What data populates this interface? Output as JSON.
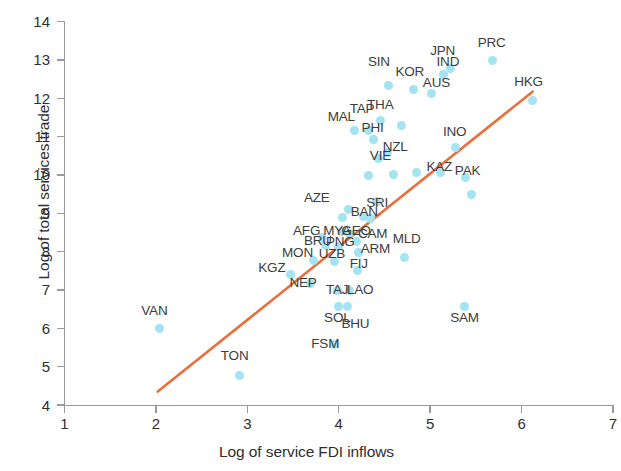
{
  "chart_data": {
    "type": "scatter",
    "title": "",
    "xlabel": "Log of service FDI inflows",
    "ylabel": "Log of total services trade",
    "xlim": [
      1,
      7
    ],
    "ylim": [
      4,
      14
    ],
    "xticks": [
      "1",
      "2",
      "3",
      "4",
      "5",
      "6",
      "7"
    ],
    "yticks": [
      "4",
      "5",
      "6",
      "7",
      "8",
      "9",
      "10",
      "11",
      "12",
      "13",
      "14"
    ],
    "grid": false,
    "legend": "none",
    "point_color": "#a4e3f2",
    "trendline_color": "#e8703c",
    "trendline": {
      "x0": 2.02,
      "y0": 4.35,
      "x1": 6.12,
      "y1": 12.17,
      "label": "fitted regression line"
    },
    "points": [
      {
        "label": "VAN",
        "x": 2.04,
        "y": 5.99,
        "lx": 1.84,
        "ly": 6.45
      },
      {
        "label": "TON",
        "x": 2.91,
        "y": 4.78,
        "lx": 2.71,
        "ly": 5.27
      },
      {
        "label": "KGZ",
        "x": 3.47,
        "y": 7.41,
        "lx": 3.12,
        "ly": 7.58
      },
      {
        "label": "NEP",
        "x": 3.69,
        "y": 7.17,
        "lx": 3.46,
        "ly": 7.17
      },
      {
        "label": "MON",
        "x": 3.72,
        "y": 7.77,
        "lx": 3.38,
        "ly": 7.97
      },
      {
        "label": "BRU",
        "x": 3.86,
        "y": 8.17,
        "lx": 3.62,
        "ly": 8.27
      },
      {
        "label": "AFG",
        "x": 3.82,
        "y": 8.36,
        "lx": 3.5,
        "ly": 8.55
      },
      {
        "label": "UZB",
        "x": 3.95,
        "y": 7.73,
        "lx": 3.78,
        "ly": 7.93
      },
      {
        "label": "PNG",
        "x": 4.0,
        "y": 8.12,
        "lx": 3.86,
        "ly": 8.26
      },
      {
        "label": "MYA",
        "x": 4.03,
        "y": 8.52,
        "lx": 3.83,
        "ly": 8.55
      },
      {
        "label": "GEO",
        "x": 4.12,
        "y": 8.46,
        "lx": 4.03,
        "ly": 8.55
      },
      {
        "label": "CAM",
        "x": 4.19,
        "y": 8.26,
        "lx": 4.21,
        "ly": 8.47
      },
      {
        "label": "ARM",
        "x": 4.22,
        "y": 7.98,
        "lx": 4.24,
        "ly": 8.08
      },
      {
        "label": "FIJ",
        "x": 4.2,
        "y": 7.52,
        "lx": 4.12,
        "ly": 7.67
      },
      {
        "label": "TAJ",
        "x": 3.99,
        "y": 6.98,
        "lx": 3.86,
        "ly": 7.0
      },
      {
        "label": "LAO",
        "x": 4.12,
        "y": 6.98,
        "lx": 4.09,
        "ly": 7.0
      },
      {
        "label": "AZE",
        "x": 4.11,
        "y": 9.1,
        "lx": 3.62,
        "ly": 9.41
      },
      {
        "label": "BAN",
        "x": 4.35,
        "y": 8.86,
        "lx": 4.13,
        "ly": 9.03
      },
      {
        "label": "SRI",
        "x": 4.41,
        "y": 9.3,
        "lx": 4.3,
        "ly": 9.28
      },
      {
        "label": "SOL",
        "x": 4.0,
        "y": 6.58,
        "lx": 3.84,
        "ly": 6.28
      },
      {
        "label": "BHU",
        "x": 4.1,
        "y": 6.56,
        "lx": 4.03,
        "ly": 6.1
      },
      {
        "label": "FSM",
        "x": 3.95,
        "y": 5.58,
        "lx": 3.7,
        "ly": 5.58
      },
      {
        "label": "MLD",
        "x": 4.72,
        "y": 7.85,
        "lx": 4.59,
        "ly": 8.32
      },
      {
        "label": "SAM",
        "x": 5.38,
        "y": 6.58,
        "lx": 5.22,
        "ly": 6.28
      },
      {
        "label": "MAL",
        "x": 4.17,
        "y": 11.17,
        "lx": 3.88,
        "ly": 11.52
      },
      {
        "label": "TAP",
        "x": 4.32,
        "y": 11.17,
        "lx": 4.12,
        "ly": 11.72
      },
      {
        "label": "THA",
        "x": 4.46,
        "y": 11.42,
        "lx": 4.31,
        "ly": 11.82
      },
      {
        "label": "PHI",
        "x": 4.38,
        "y": 10.92,
        "lx": 4.25,
        "ly": 11.22
      },
      {
        "label": "NZL",
        "x": 4.53,
        "y": 10.58,
        "lx": 4.48,
        "ly": 10.73
      },
      {
        "label": "VIE",
        "x": 4.44,
        "y": 10.43,
        "lx": 4.34,
        "ly": 10.48
      },
      {
        "label": "SIN",
        "x": 4.54,
        "y": 12.33,
        "lx": 4.32,
        "ly": 12.95
      },
      {
        "label": "KOR",
        "x": 4.82,
        "y": 12.23,
        "lx": 4.62,
        "ly": 12.68
      },
      {
        "label": "AUS",
        "x": 5.02,
        "y": 12.11,
        "lx": 4.92,
        "ly": 12.4
      },
      {
        "label": "JPN",
        "x": 5.15,
        "y": 12.63,
        "lx": 5.0,
        "ly": 13.23
      },
      {
        "label": "IND",
        "x": 5.22,
        "y": 12.77,
        "lx": 5.07,
        "ly": 12.94
      },
      {
        "label": "PRC",
        "x": 5.68,
        "y": 12.98,
        "lx": 5.52,
        "ly": 13.44
      },
      {
        "label": "HKG",
        "x": 6.12,
        "y": 11.95,
        "lx": 5.92,
        "ly": 12.42
      },
      {
        "label": "INO",
        "x": 5.28,
        "y": 10.72,
        "lx": 5.14,
        "ly": 11.11
      },
      {
        "label": "KAZ",
        "x": 5.11,
        "y": 10.05,
        "lx": 4.96,
        "ly": 10.2
      },
      {
        "label": "PAK",
        "x": 5.39,
        "y": 9.94,
        "lx": 5.27,
        "ly": 10.09
      }
    ],
    "unlabeled_points": [
      {
        "x": 5.45,
        "y": 9.49
      },
      {
        "x": 4.85,
        "y": 10.05
      },
      {
        "x": 4.69,
        "y": 11.3
      },
      {
        "x": 4.6,
        "y": 10.02
      },
      {
        "x": 4.33,
        "y": 9.98
      },
      {
        "x": 4.27,
        "y": 8.92
      },
      {
        "x": 4.04,
        "y": 8.88
      }
    ]
  }
}
